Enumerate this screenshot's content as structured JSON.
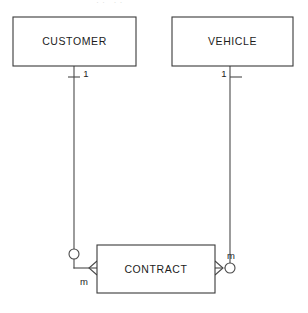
{
  "diagram": {
    "type": "entity-relationship-diagram",
    "notation": "crow's foot",
    "background_color": "#ffffff",
    "line_color": "#4a4a4a",
    "text_color": "#1c1c1c",
    "entities": [
      {
        "id": "customer",
        "label": "CUSTOMER",
        "x": 13,
        "y": 17,
        "width": 123,
        "height": 49
      },
      {
        "id": "vehicle",
        "label": "VEHICLE",
        "x": 172,
        "y": 17,
        "width": 121,
        "height": 49
      },
      {
        "id": "contract",
        "label": "CONTRACT",
        "x": 97,
        "y": 245,
        "width": 118,
        "height": 48
      }
    ],
    "relationships": [
      {
        "id": "customer-contract",
        "from": "customer",
        "to": "contract",
        "from_cardinality": "1",
        "to_cardinality": "m",
        "to_optional": true
      },
      {
        "id": "vehicle-contract",
        "from": "vehicle",
        "to": "contract",
        "from_cardinality": "1",
        "to_cardinality": "m",
        "to_optional": true
      }
    ],
    "cardinality_labels": {
      "customer_one": "1",
      "vehicle_one": "1",
      "contract_left_many": "m",
      "contract_right_many": "m"
    },
    "top_cutoff_artifact": "·· ··"
  }
}
